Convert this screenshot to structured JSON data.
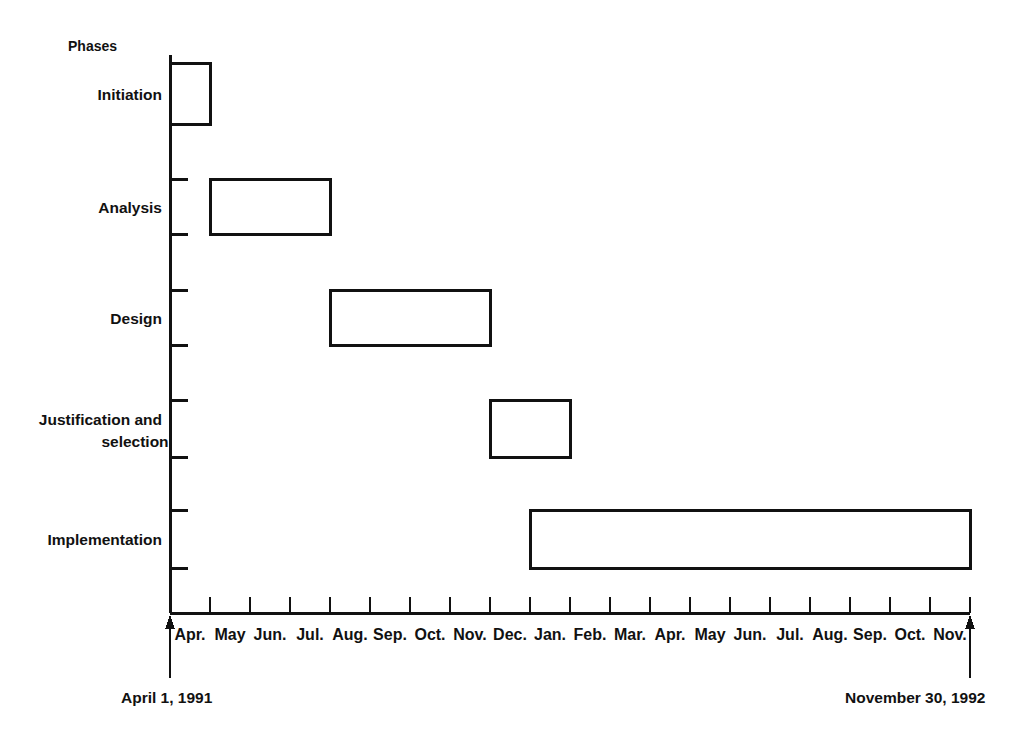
{
  "chart_data": {
    "type": "bar",
    "chart_kind": "gantt",
    "title": "",
    "ylabel": "Phases",
    "xlabel": "",
    "grid": false,
    "legend": null,
    "axis_start_date": "April 1, 1991",
    "axis_end_date": "November 30, 1992",
    "x_tick_labels": [
      "Apr.",
      "May",
      "Jun.",
      "Jul.",
      "Aug.",
      "Sep.",
      "Oct.",
      "Nov.",
      "Dec.",
      "Jan.",
      "Feb.",
      "Mar.",
      "Apr.",
      "May",
      "Jun.",
      "Jul.",
      "Aug.",
      "Sep.",
      "Oct.",
      "Nov."
    ],
    "x_tick_years": [
      1991,
      1991,
      1991,
      1991,
      1991,
      1991,
      1991,
      1991,
      1991,
      1992,
      1992,
      1992,
      1992,
      1992,
      1992,
      1992,
      1992,
      1992,
      1992,
      1992
    ],
    "categories": [
      "Initiation",
      "Analysis",
      "Design",
      "Justification and selection",
      "Implementation"
    ],
    "tasks": [
      {
        "name": "Initiation",
        "label_line1": "Initiation",
        "label_line2": "",
        "start_month_index": 0,
        "end_month_index": 1,
        "start_label": "Apr. 1991",
        "end_label": "May 1991",
        "duration_months": 1
      },
      {
        "name": "Analysis",
        "label_line1": "Analysis",
        "label_line2": "",
        "start_month_index": 1,
        "end_month_index": 4,
        "start_label": "May 1991",
        "end_label": "Aug. 1991",
        "duration_months": 3
      },
      {
        "name": "Design",
        "label_line1": "Design",
        "label_line2": "",
        "start_month_index": 4,
        "end_month_index": 8,
        "start_label": "Aug. 1991",
        "end_label": "Dec. 1991",
        "duration_months": 4
      },
      {
        "name": "Justification and selection",
        "label_line1": "Justification and",
        "label_line2": "selection",
        "start_month_index": 8,
        "end_month_index": 10,
        "start_label": "Dec. 1991",
        "end_label": "Feb. 1992",
        "duration_months": 2
      },
      {
        "name": "Implementation",
        "label_line1": "Implementation",
        "label_line2": "",
        "start_month_index": 9,
        "end_month_index": 20,
        "start_label": "Jan. 1992",
        "end_label": "Nov. 1992",
        "duration_months": 11
      }
    ]
  },
  "figure": {
    "phases_heading": "Phases",
    "start_caption": "April 1, 1991",
    "end_caption": "November 30, 1992",
    "stroke_color": "#111111",
    "bar_fill": "#ffffff",
    "background": "#ffffff"
  }
}
